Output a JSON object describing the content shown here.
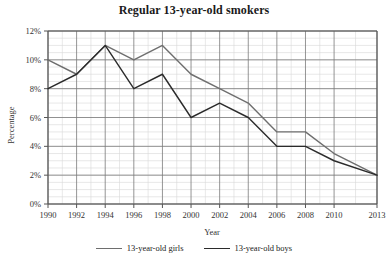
{
  "chart_data": {
    "type": "line",
    "title": "Regular 13-year-old smokers",
    "xlabel": "Year",
    "ylabel": "Percentage",
    "x": [
      1990,
      1992,
      1994,
      1996,
      1998,
      2000,
      2002,
      2004,
      2006,
      2008,
      2010,
      2013
    ],
    "xtick_labels": [
      "1990",
      "1992",
      "1994",
      "1996",
      "1998",
      "2000",
      "2002",
      "2004",
      "2006",
      "2008",
      "2010",
      "2013"
    ],
    "ytick_labels": [
      "0%",
      "2%",
      "4%",
      "6%",
      "8%",
      "10%",
      "12%"
    ],
    "ytick_values": [
      0,
      2,
      4,
      6,
      8,
      10,
      12
    ],
    "ylim": [
      0,
      12
    ],
    "xlim": [
      1990,
      2013
    ],
    "grid": true,
    "minor_grid": true,
    "legend_position": "bottom",
    "series": [
      {
        "name": "13-year-old girls",
        "color": "#6e6e6e",
        "values": [
          10,
          9,
          11,
          10,
          11,
          9,
          8,
          7,
          5,
          5,
          3.5,
          2
        ]
      },
      {
        "name": "13-year-old boys",
        "color": "#2b2b2b",
        "values": [
          8,
          9,
          11,
          8,
          9,
          6,
          7,
          6,
          4,
          4,
          3,
          2
        ]
      }
    ]
  },
  "colors": {
    "axis": "#555555",
    "major_grid": "#7a7a7a",
    "minor_grid": "#d8d8d8",
    "text": "#1a1a1a",
    "girls_line": "#6e6e6e",
    "boys_line": "#2b2b2b"
  }
}
